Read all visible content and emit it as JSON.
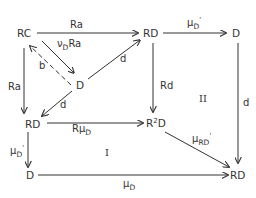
{
  "diagram": {
    "type": "commutative-diagram",
    "nodes": {
      "rc": "RC",
      "rd_top": "RD",
      "d_top_right": "D",
      "d_center": "D",
      "rd_left": "RD",
      "r2d_base": "R",
      "r2d_sup": "2",
      "r2d_tail": "D",
      "d_bottom_left": "D",
      "rd_bottom_right": "RD"
    },
    "edges": {
      "rc_to_rd_top": {
        "label": "Ra"
      },
      "rc_to_d_center": {
        "label_main": "ν",
        "label_sub": "D",
        "label_tail": "Ra"
      },
      "d_center_to_rc": {
        "label": "b",
        "style": "dashed"
      },
      "d_center_to_rd_top": {
        "label": "d"
      },
      "rc_to_rd_left": {
        "label": "Ra"
      },
      "d_center_to_rd_left": {
        "label": "d"
      },
      "rd_top_to_d_top_right": {
        "label_main": "μ",
        "label_sub": "D",
        "label_prime": "'"
      },
      "rd_top_to_r2d": {
        "label": "Rd"
      },
      "d_top_right_to_rd_bottom_right": {
        "label": "d"
      },
      "rd_left_to_r2d": {
        "label_main": "Rμ",
        "label_sub": "D"
      },
      "r2d_to_rd_bottom_right": {
        "label_main": "μ",
        "label_sub": "RD",
        "label_prime": "'"
      },
      "rd_left_to_d_bottom_left": {
        "label_main": "μ",
        "label_sub": "D",
        "label_prime": "'"
      },
      "d_bottom_left_to_rd_bottom_right": {
        "label_main": "μ",
        "label_sub": "D"
      }
    },
    "regions": {
      "region_one": "I",
      "region_two": "II"
    },
    "colors": {
      "ink": "#333333",
      "background": "#ffffff"
    }
  }
}
